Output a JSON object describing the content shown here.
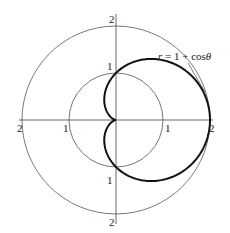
{
  "diagram": {
    "title": "",
    "equation_label": "r = 1 + cosθ",
    "equation_parts": {
      "lhs": "r",
      "eq": " = 1 + cos",
      "theta": "θ"
    },
    "colors": {
      "axes": "#444444",
      "circles": "#555555",
      "curve": "#111111",
      "background": "#ffffff"
    },
    "center": {
      "x": 116,
      "y": 120
    },
    "unit_px": 47,
    "reference_circles": [
      {
        "r": 1,
        "label": "r = 1"
      },
      {
        "r": 2,
        "label": "r = 2"
      }
    ],
    "axis_labels": {
      "top_2": "2",
      "top_1": "1",
      "bottom_1": "1",
      "bottom_2": "2",
      "left_2": "2",
      "left_1": "1",
      "right_1": "1",
      "right_2": "2"
    },
    "curve": {
      "type": "cardioid",
      "equation": "r = 1 + cos(theta)"
    }
  }
}
